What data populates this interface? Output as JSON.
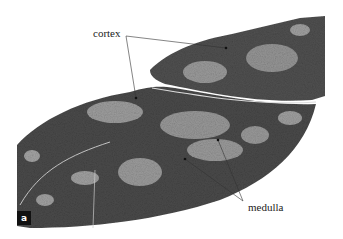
{
  "figure": {
    "panel_label": "a",
    "labels": [
      {
        "id": "cortex",
        "text": "cortex",
        "x": 93,
        "y": 28
      },
      {
        "id": "medulla",
        "text": "medulla",
        "x": 248,
        "y": 202
      }
    ],
    "leader_lines": [
      {
        "from": "cortex",
        "x1": 126,
        "y1": 36,
        "x2": 226,
        "y2": 48
      },
      {
        "from": "cortex",
        "x1": 126,
        "y1": 36,
        "x2": 136,
        "y2": 98
      },
      {
        "from": "medulla",
        "x1": 243,
        "y1": 201,
        "x2": 218,
        "y2": 140
      },
      {
        "from": "medulla",
        "x1": 243,
        "y1": 201,
        "x2": 185,
        "y2": 159
      }
    ],
    "colors": {
      "cortex": "#4a4a4a",
      "medulla": "#9a9a9a",
      "background": "#ffffff",
      "line": "#333333"
    }
  }
}
